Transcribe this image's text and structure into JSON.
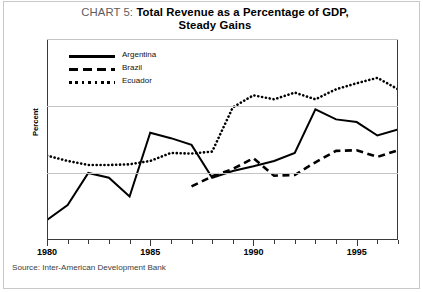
{
  "title": {
    "prefix": "CHART 5:",
    "main_line1": "Total Revenue as a Percentage of GDP,",
    "main_line2": "Steady Gains"
  },
  "source": {
    "text": "Source: Inter-American Development Bank"
  },
  "legend": {
    "position": "top-left-inside",
    "items": [
      {
        "label": "Argentina",
        "style": "solid",
        "color": "#000000",
        "swatch_icon": "solid-line-icon"
      },
      {
        "label": "Brazil",
        "style": "dashed",
        "color": "#000000",
        "swatch_icon": "dashed-line-icon"
      },
      {
        "label": "Ecuador",
        "style": "dotted",
        "color": "#000000",
        "swatch_icon": "dotted-line-icon"
      }
    ]
  },
  "chart_data": {
    "type": "line",
    "title": "CHART 5: Total Revenue as a Percentage of GDP, Steady Gains",
    "xlabel": "",
    "ylabel": "Percent",
    "xlim": [
      1980,
      1997
    ],
    "ylim": [
      0,
      30
    ],
    "yticks": [
      0,
      10,
      20,
      30
    ],
    "ytick_labels": [
      "0",
      "10",
      "20",
      "30"
    ],
    "xticks": [
      1980,
      1981,
      1982,
      1983,
      1984,
      1985,
      1986,
      1987,
      1988,
      1989,
      1990,
      1991,
      1992,
      1993,
      1994,
      1995,
      1996,
      1997
    ],
    "xtick_labels_shown": [
      "1980",
      "1985",
      "1990",
      "1995"
    ],
    "xtick_labels_shown_at": [
      1980,
      1985,
      1990,
      1995
    ],
    "grid": "horizontal",
    "legend_position": "upper left (inside axes)",
    "x": [
      1980,
      1981,
      1982,
      1983,
      1984,
      1985,
      1986,
      1987,
      1988,
      1989,
      1990,
      1991,
      1992,
      1993,
      1994,
      1995,
      1996,
      1997
    ],
    "series": [
      {
        "name": "Argentina",
        "style": "solid",
        "color": "#000000",
        "x": [
          1980,
          1981,
          1982,
          1983,
          1984,
          1985,
          1986,
          1987,
          1988,
          1989,
          1990,
          1991,
          1992,
          1993,
          1994,
          1995,
          1996,
          1997
        ],
        "values": [
          3.0,
          5.2,
          10.0,
          9.3,
          6.5,
          16.0,
          15.2,
          14.2,
          9.3,
          10.3,
          11.0,
          11.8,
          13.0,
          19.5,
          18.0,
          17.6,
          15.6,
          16.5
        ]
      },
      {
        "name": "Brazil",
        "style": "dashed",
        "color": "#000000",
        "x": [
          1987,
          1988,
          1989,
          1990,
          1991,
          1992,
          1993,
          1994,
          1995,
          1996,
          1997
        ],
        "values": [
          8.0,
          9.5,
          10.6,
          12.2,
          9.6,
          9.7,
          11.6,
          13.3,
          13.4,
          12.4,
          13.4
        ]
      },
      {
        "name": "Ecuador",
        "style": "dotted",
        "color": "#000000",
        "x": [
          1980,
          1981,
          1982,
          1983,
          1984,
          1985,
          1986,
          1987,
          1988,
          1989,
          1990,
          1991,
          1992,
          1993,
          1994,
          1995,
          1996,
          1997
        ],
        "values": [
          12.6,
          11.8,
          11.2,
          11.2,
          11.3,
          11.8,
          13.0,
          12.9,
          13.2,
          19.8,
          21.6,
          21.0,
          22.0,
          21.0,
          22.5,
          23.4,
          24.2,
          22.5
        ]
      }
    ]
  }
}
